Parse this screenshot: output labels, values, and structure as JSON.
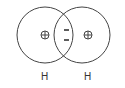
{
  "diagram": {
    "atoms": [
      {
        "label": "H",
        "nucleus_charge": "+"
      },
      {
        "label": "H",
        "nucleus_charge": "+"
      }
    ],
    "shared_electrons": [
      "-",
      "-"
    ],
    "colors": {
      "stroke": "#444444",
      "text": "#333333",
      "background": "#ffffff"
    }
  }
}
